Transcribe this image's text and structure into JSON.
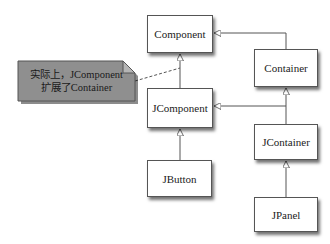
{
  "diagram": {
    "type": "uml-class-hierarchy",
    "classes": [
      {
        "id": "component",
        "label": "Component"
      },
      {
        "id": "container",
        "label": "Container"
      },
      {
        "id": "jcomponent",
        "label": "JComponent"
      },
      {
        "id": "jcontainer",
        "label": "JContainer"
      },
      {
        "id": "jbutton",
        "label": "JButton"
      },
      {
        "id": "jpanel",
        "label": "JPanel"
      }
    ],
    "relations": [
      {
        "from": "container",
        "to": "component",
        "kind": "inheritance"
      },
      {
        "from": "jcomponent",
        "to": "component",
        "kind": "inheritance"
      },
      {
        "from": "jcontainer",
        "to": "container",
        "kind": "inheritance"
      },
      {
        "from": "jcontainer",
        "to": "jcomponent",
        "kind": "inheritance"
      },
      {
        "from": "jbutton",
        "to": "jcomponent",
        "kind": "inheritance"
      },
      {
        "from": "jpanel",
        "to": "jcontainer",
        "kind": "inheritance"
      }
    ],
    "note": {
      "line1": "实际上，JComponent",
      "line2": "扩展了Container",
      "attached_to": "jcomponent-component-link",
      "fill_color": "#8f8f8f"
    },
    "colors": {
      "line": "#555555",
      "box_border": "#555555",
      "background": "#ffffff"
    }
  }
}
